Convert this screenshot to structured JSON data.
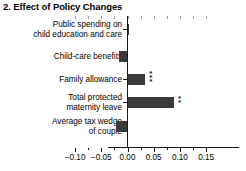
{
  "chart_data": {
    "type": "bar",
    "orientation": "horizontal",
    "title": "2. Effect of Policy Changes",
    "xlabel": "",
    "ylabel": "",
    "categories": [
      "Public spending on child education and care",
      "Child-care benefits",
      "Family allowance",
      "Total protected maternity leave",
      "Average tax wedge of couple"
    ],
    "category_lines": [
      [
        "Public spending on",
        "child education and care"
      ],
      [
        "Child-care benefits"
      ],
      [
        "Family allowance"
      ],
      [
        "Total protected",
        "maternity leave"
      ],
      [
        "Average tax wedge",
        "of couple"
      ]
    ],
    "values": [
      0.001,
      -0.017,
      0.033,
      0.088,
      -0.022
    ],
    "significance": [
      "",
      "",
      "***",
      "**",
      ""
    ],
    "xlim": [
      -0.115,
      0.16
    ],
    "xticks": [
      -0.1,
      -0.05,
      0.0,
      0.05,
      0.1,
      0.15
    ],
    "xticklabels": [
      "−0.10",
      "−0.05",
      "0.00",
      "0.05",
      "0.10",
      "0.15"
    ],
    "grid": false,
    "legend": null,
    "zero_line": 0.0
  }
}
